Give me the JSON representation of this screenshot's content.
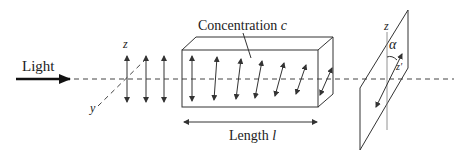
{
  "diagram": {
    "light_label": "Light",
    "axis_z": "z",
    "axis_y": "y",
    "sample_label": "Concentration",
    "sample_symbol": "c",
    "length_label": "Length",
    "length_symbol": "l",
    "analyzer_axis": "z",
    "rotated_axis": "z′",
    "angle_symbol": "α"
  }
}
